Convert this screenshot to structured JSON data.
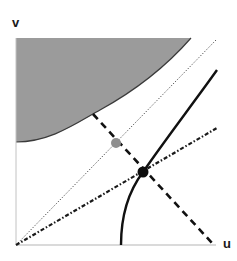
{
  "figure": {
    "axes": {
      "x_label": "u",
      "y_label": "v",
      "origin": [
        16,
        245
      ],
      "x_end": [
        216,
        245
      ],
      "y_end": [
        16,
        38
      ]
    },
    "colors": {
      "shaded_region": "#9b9b9b",
      "axis": "#b5b5b5",
      "curve": "#111111",
      "gray_point": "#8f8f8f",
      "black_point": "#0d0d0d"
    },
    "elements": [
      {
        "id": "shaded-region",
        "type": "filled-region",
        "description": "gray region in upper-left bounded below by convex curve"
      },
      {
        "id": "dotted-diagonal",
        "type": "dotted-line",
        "from": [
          16,
          245
        ],
        "to": [
          217,
          39
        ]
      },
      {
        "id": "dash-dot-line",
        "type": "dash-dot-line",
        "from": [
          16,
          245
        ],
        "to": [
          217,
          128
        ]
      },
      {
        "id": "dashed-line",
        "type": "dashed-line",
        "from": [
          93,
          114
        ],
        "to": [
          212,
          243
        ]
      },
      {
        "id": "solid-curve",
        "type": "solid-curve",
        "from": [
          121,
          245
        ],
        "through": [
          143,
          172
        ],
        "to": [
          217,
          70
        ]
      },
      {
        "id": "gray-point",
        "type": "point",
        "at": [
          116,
          143
        ]
      },
      {
        "id": "black-point",
        "type": "point",
        "at": [
          143,
          172
        ]
      }
    ]
  }
}
